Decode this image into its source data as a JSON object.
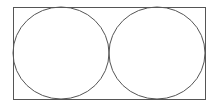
{
  "diagram": {
    "type": "geometric-figure",
    "stroke_color": "#555555",
    "rectangle": {
      "x": 13,
      "y": 7,
      "width": 192,
      "height": 92
    },
    "circles": [
      {
        "cx": 61,
        "cy": 53,
        "rx": 48,
        "ry": 46
      },
      {
        "cx": 157,
        "cy": 53,
        "rx": 48,
        "ry": 46
      }
    ]
  }
}
